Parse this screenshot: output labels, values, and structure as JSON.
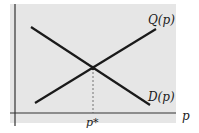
{
  "diagram": {
    "type": "supply-demand",
    "curves": [
      {
        "name": "Q(p)",
        "label": "Q(p)",
        "direction": "increasing"
      },
      {
        "name": "D(p)",
        "label": "D(p)",
        "direction": "decreasing"
      }
    ],
    "x_axis_label": "p",
    "equilibrium_label": "p*",
    "colors": {
      "background": "#e6e6e6",
      "line": "#1a1a1a",
      "axis": "#333333"
    }
  }
}
